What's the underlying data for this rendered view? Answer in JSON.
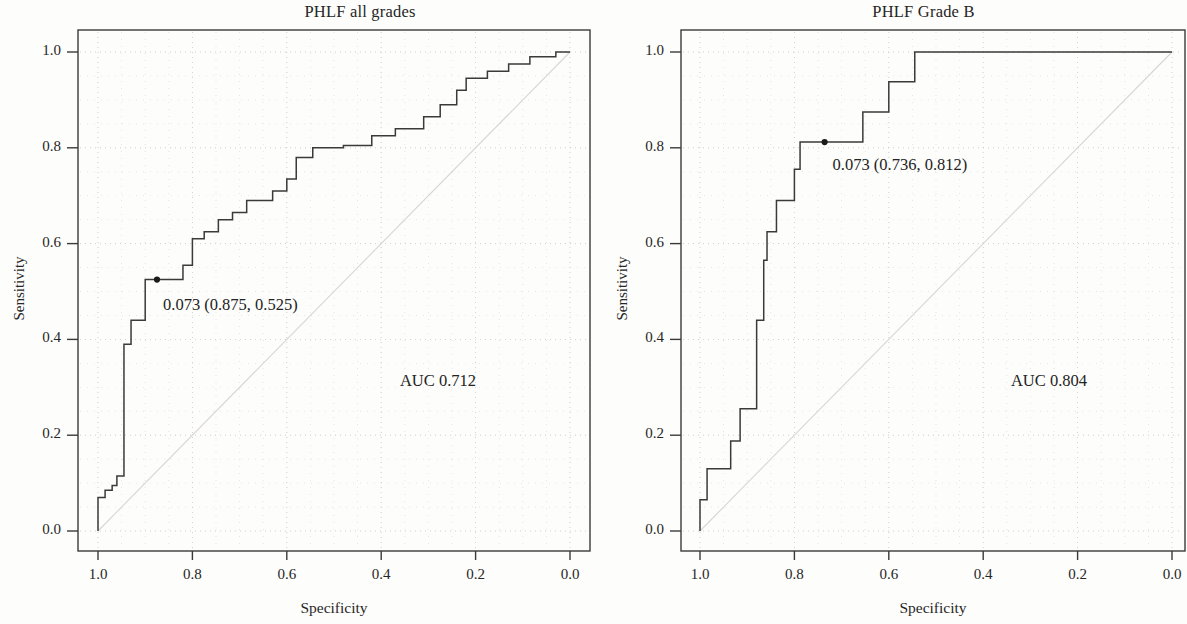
{
  "figure": {
    "background": "#fdfdfb",
    "ink": "#3a3a3a",
    "grid_color": "#b9b9b9"
  },
  "chart_data": [
    {
      "type": "line",
      "id": "phlf-all-grades",
      "title": "PHLF all grades",
      "xlabel": "Specificity",
      "ylabel": "Sensitivity",
      "xlim": [
        1.0,
        0.0
      ],
      "ylim": [
        0.0,
        1.0
      ],
      "x_ticks": [
        "1.0",
        "0.8",
        "0.6",
        "0.4",
        "0.2",
        "0.0"
      ],
      "x_tick_values": [
        1.0,
        0.8,
        0.6,
        0.4,
        0.2,
        0.0
      ],
      "y_ticks": [
        "0.0",
        "0.2",
        "0.4",
        "0.6",
        "0.8",
        "1.0"
      ],
      "y_tick_values": [
        0.0,
        0.2,
        0.4,
        0.6,
        0.8,
        1.0
      ],
      "x_axis_reversed": true,
      "grid": "dotted-minor",
      "reference_diagonal": true,
      "auc_label": "AUC 0.712",
      "auc_value": 0.712,
      "annotation": {
        "text": "0.073 (0.875, 0.525)",
        "threshold": 0.073,
        "specificity": 0.875,
        "sensitivity": 0.525,
        "marker": "filled-dot"
      },
      "series": [
        {
          "name": "ROC curve",
          "style": "step",
          "points": [
            [
              1.0,
              0.0
            ],
            [
              1.0,
              0.07
            ],
            [
              0.985,
              0.07
            ],
            [
              0.985,
              0.085
            ],
            [
              0.97,
              0.085
            ],
            [
              0.97,
              0.095
            ],
            [
              0.96,
              0.095
            ],
            [
              0.96,
              0.115
            ],
            [
              0.945,
              0.115
            ],
            [
              0.945,
              0.39
            ],
            [
              0.93,
              0.39
            ],
            [
              0.93,
              0.44
            ],
            [
              0.9,
              0.44
            ],
            [
              0.9,
              0.525
            ],
            [
              0.875,
              0.525
            ],
            [
              0.82,
              0.525
            ],
            [
              0.82,
              0.555
            ],
            [
              0.8,
              0.555
            ],
            [
              0.8,
              0.61
            ],
            [
              0.775,
              0.61
            ],
            [
              0.775,
              0.625
            ],
            [
              0.745,
              0.625
            ],
            [
              0.745,
              0.65
            ],
            [
              0.715,
              0.65
            ],
            [
              0.715,
              0.665
            ],
            [
              0.685,
              0.665
            ],
            [
              0.685,
              0.69
            ],
            [
              0.63,
              0.69
            ],
            [
              0.63,
              0.71
            ],
            [
              0.6,
              0.71
            ],
            [
              0.6,
              0.735
            ],
            [
              0.58,
              0.735
            ],
            [
              0.58,
              0.78
            ],
            [
              0.545,
              0.78
            ],
            [
              0.545,
              0.8
            ],
            [
              0.48,
              0.8
            ],
            [
              0.48,
              0.805
            ],
            [
              0.42,
              0.805
            ],
            [
              0.42,
              0.825
            ],
            [
              0.37,
              0.825
            ],
            [
              0.37,
              0.84
            ],
            [
              0.31,
              0.84
            ],
            [
              0.31,
              0.865
            ],
            [
              0.275,
              0.865
            ],
            [
              0.275,
              0.89
            ],
            [
              0.24,
              0.89
            ],
            [
              0.24,
              0.92
            ],
            [
              0.22,
              0.92
            ],
            [
              0.22,
              0.945
            ],
            [
              0.175,
              0.945
            ],
            [
              0.175,
              0.96
            ],
            [
              0.13,
              0.96
            ],
            [
              0.13,
              0.975
            ],
            [
              0.085,
              0.975
            ],
            [
              0.085,
              0.99
            ],
            [
              0.03,
              0.99
            ],
            [
              0.03,
              1.0
            ],
            [
              0.0,
              1.0
            ]
          ]
        }
      ]
    },
    {
      "type": "line",
      "id": "phlf-grade-b",
      "title": "PHLF Grade B",
      "xlabel": "Specificity",
      "ylabel": "Sensitivity",
      "xlim": [
        1.0,
        0.0
      ],
      "ylim": [
        0.0,
        1.0
      ],
      "x_ticks": [
        "1.0",
        "0.8",
        "0.6",
        "0.4",
        "0.2",
        "0.0"
      ],
      "x_tick_values": [
        1.0,
        0.8,
        0.6,
        0.4,
        0.2,
        0.0
      ],
      "y_ticks": [
        "0.0",
        "0.2",
        "0.4",
        "0.6",
        "0.8",
        "1.0"
      ],
      "y_tick_values": [
        0.0,
        0.2,
        0.4,
        0.6,
        0.8,
        1.0
      ],
      "x_axis_reversed": true,
      "grid": "dotted-minor",
      "reference_diagonal": true,
      "auc_label": "AUC 0.804",
      "auc_value": 0.804,
      "annotation": {
        "text": "0.073 (0.736, 0.812)",
        "threshold": 0.073,
        "specificity": 0.736,
        "sensitivity": 0.812,
        "marker": "filled-dot"
      },
      "series": [
        {
          "name": "ROC curve",
          "style": "step",
          "points": [
            [
              1.0,
              0.0
            ],
            [
              1.0,
              0.065
            ],
            [
              0.985,
              0.065
            ],
            [
              0.985,
              0.13
            ],
            [
              0.935,
              0.13
            ],
            [
              0.935,
              0.188
            ],
            [
              0.915,
              0.188
            ],
            [
              0.915,
              0.255
            ],
            [
              0.88,
              0.255
            ],
            [
              0.88,
              0.44
            ],
            [
              0.865,
              0.44
            ],
            [
              0.865,
              0.565
            ],
            [
              0.858,
              0.565
            ],
            [
              0.858,
              0.625
            ],
            [
              0.838,
              0.625
            ],
            [
              0.838,
              0.69
            ],
            [
              0.8,
              0.69
            ],
            [
              0.8,
              0.755
            ],
            [
              0.788,
              0.755
            ],
            [
              0.788,
              0.812
            ],
            [
              0.736,
              0.812
            ],
            [
              0.655,
              0.812
            ],
            [
              0.655,
              0.875
            ],
            [
              0.6,
              0.875
            ],
            [
              0.6,
              0.938
            ],
            [
              0.545,
              0.938
            ],
            [
              0.545,
              1.0
            ],
            [
              0.0,
              1.0
            ]
          ]
        }
      ]
    }
  ]
}
